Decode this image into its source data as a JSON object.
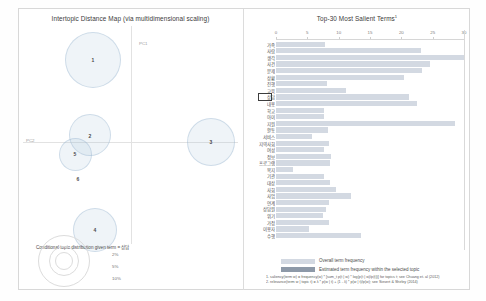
{
  "chart_data": [
    {
      "type": "scatter",
      "title": "Intertopic Distance Map (via multidimensional scaling)",
      "xlabel": "PC1",
      "ylabel": "PC2",
      "grid": false,
      "legend_position": "bottom-left",
      "legend_title": "Conditional topic distribution given term = 상담",
      "size_legend": [
        "2%",
        "5%",
        "10%"
      ],
      "points": [
        {
          "topic": "1",
          "x": -0.42,
          "y": 0.55,
          "radius_pct": 10.0
        },
        {
          "topic": "2",
          "x": -0.44,
          "y": -0.08,
          "radius_pct": 6.4
        },
        {
          "topic": "5",
          "x": -0.52,
          "y": -0.3,
          "radius_pct": 4.6
        },
        {
          "topic": "6",
          "x": -0.47,
          "y": -0.57,
          "radius_pct": 0.0
        },
        {
          "topic": "3",
          "x": 0.52,
          "y": -0.17,
          "radius_pct": 7.6
        },
        {
          "topic": "4",
          "x": -0.3,
          "y": -1.0,
          "radius_pct": 6.0
        }
      ]
    },
    {
      "type": "bar",
      "orientation": "horizontal",
      "title": "Top-30 Most Salient Terms",
      "title_superscript": "1",
      "xlabel": "",
      "ylabel": "",
      "xlim": [
        0,
        30
      ],
      "xticks": [
        0,
        5,
        10,
        15,
        20,
        25,
        30
      ],
      "grid": false,
      "legend_position": "bottom",
      "series": [
        {
          "name": "Overall term frequency",
          "color": "#d3d9e2"
        },
        {
          "name": "Estimated term frequency within the selected topic",
          "color": "#8d99a8"
        }
      ],
      "selected_term_index": 8,
      "categories": [
        "가족",
        "사람",
        "생각",
        "사건",
        "문제",
        "상황",
        "진행",
        "교육",
        "상담",
        "내용",
        "학교",
        "아이",
        "지원",
        "활동",
        "서비스",
        "지역사회",
        "여성",
        "정보",
        "프로그램",
        "복지",
        "기관",
        "대상",
        "사회",
        "사업",
        "연계",
        "상담원",
        "위기",
        "가정",
        "이용자",
        "수행"
      ],
      "values_overall": [
        7.8,
        23.2,
        30.0,
        24.5,
        23.3,
        20.4,
        8.1,
        11.2,
        21.2,
        22.5,
        7.7,
        7.7,
        28.6,
        8.3,
        5.7,
        8.5,
        7.6,
        8.7,
        8.6,
        2.7,
        7.6,
        8.6,
        9.6,
        12.0,
        8.4,
        8.0,
        7.5,
        8.4,
        5.2,
        13.5
      ],
      "values_selected": [
        7.8,
        23.2,
        30.0,
        24.5,
        23.3,
        20.4,
        8.1,
        11.2,
        21.2,
        22.5,
        7.7,
        7.7,
        28.6,
        8.3,
        3.6,
        8.5,
        7.6,
        8.7,
        8.6,
        2.7,
        7.6,
        8.6,
        9.6,
        12.0,
        8.4,
        8.0,
        7.5,
        8.4,
        5.2,
        13.5
      ]
    }
  ],
  "mds_panel": {
    "title": "Intertopic Distance Map (via multidimensional scaling)",
    "pc1_label": "PC1",
    "pc2_label": "PC2",
    "marginal_legend_title": "Conditional topic distribution given term = 상담",
    "pct_labels": [
      "2%",
      "5%",
      "10%"
    ],
    "topics": [
      {
        "label": "1"
      },
      {
        "label": "2"
      },
      {
        "label": "5"
      },
      {
        "label": "6"
      },
      {
        "label": "3"
      },
      {
        "label": "4"
      }
    ]
  },
  "bar_panel": {
    "title": "Top-30 Most Salient Terms",
    "title_superscript": "1",
    "ticks": [
      "0",
      "5",
      "10",
      "15",
      "20",
      "25",
      "30"
    ],
    "legend": {
      "overall_label": "Overall term frequency",
      "selected_label": "Estimated term frequency within the selected topic"
    },
    "footnotes": [
      "1. saliency(term w) = frequency(w) * [sum_t p(t | w) * log(p(t | w)/p(t))] for topics t; see Chuang et. al (2012)",
      "2. relevance(term w | topic t) = λ * p(w | t) + (1 - λ) * p(w | t)/p(w); see Sievert & Shirley (2014)"
    ]
  },
  "colors": {
    "bar_overall": "#d3d9e2",
    "bar_selected": "#8d99a8",
    "circle_fill": "rgba(160,190,215,.17)",
    "circle_stroke": "rgba(150,180,205,.38)",
    "text": "#3b3b3b"
  }
}
